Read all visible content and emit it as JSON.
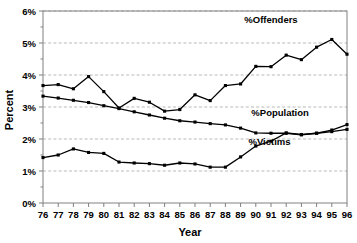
{
  "chart_data": {
    "type": "line",
    "title": "",
    "xlabel": "Year",
    "ylabel": "Percent",
    "ylim": [
      0,
      6
    ],
    "ytick_labels": [
      "0%",
      "1%",
      "2%",
      "3%",
      "4%",
      "5%",
      "6%"
    ],
    "ytick_values": [
      0,
      1,
      2,
      3,
      4,
      5,
      6
    ],
    "grid": true,
    "legend_position": "inline-annotations",
    "categories": [
      "76",
      "77",
      "78",
      "79",
      "80",
      "81",
      "82",
      "83",
      "84",
      "85",
      "86",
      "87",
      "88",
      "89",
      "90",
      "91",
      "92",
      "93",
      "94",
      "95",
      "96"
    ],
    "x": [
      1976,
      1977,
      1978,
      1979,
      1980,
      1981,
      1982,
      1983,
      1984,
      1985,
      1986,
      1987,
      1988,
      1989,
      1990,
      1991,
      1992,
      1993,
      1994,
      1995,
      1996
    ],
    "series": [
      {
        "name": "%Offenders",
        "label": "%Offenders",
        "color": "#000000",
        "marker": "square",
        "values": [
          3.67,
          3.7,
          3.57,
          3.95,
          3.48,
          2.97,
          3.27,
          3.15,
          2.87,
          2.92,
          3.38,
          3.2,
          3.67,
          3.72,
          4.27,
          4.26,
          4.62,
          4.48,
          4.87,
          5.11,
          4.65
        ]
      },
      {
        "name": "%Population",
        "label": "%Population",
        "color": "#000000",
        "marker": "square",
        "values": [
          3.34,
          3.28,
          3.21,
          3.14,
          3.04,
          2.95,
          2.85,
          2.75,
          2.65,
          2.57,
          2.53,
          2.48,
          2.44,
          2.34,
          2.19,
          2.18,
          2.18,
          2.13,
          2.18,
          2.28,
          2.45
        ]
      },
      {
        "name": "%Victims",
        "label": "%Victims",
        "color": "#000000",
        "marker": "square",
        "values": [
          1.42,
          1.5,
          1.69,
          1.58,
          1.55,
          1.28,
          1.25,
          1.23,
          1.18,
          1.25,
          1.22,
          1.12,
          1.12,
          1.44,
          1.78,
          1.93,
          2.19,
          2.14,
          2.18,
          2.23,
          2.3
        ]
      }
    ],
    "annotations": [
      {
        "text": "%Offenders",
        "x_year": 1991.0,
        "y_value": 5.62
      },
      {
        "text": "%Population",
        "x_year": 1991.6,
        "y_value": 2.73
      },
      {
        "text": "%Victims",
        "x_year": 1990.9,
        "y_value": 1.8
      }
    ]
  }
}
